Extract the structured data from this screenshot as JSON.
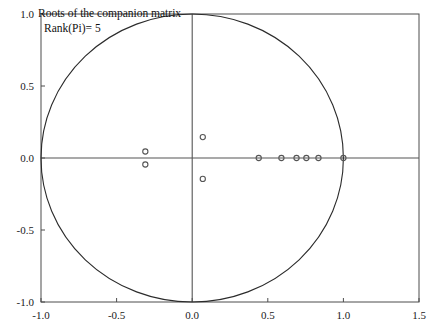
{
  "chart_data": {
    "type": "scatter",
    "title": "Roots of the companion matrix",
    "annotation": "Rank(Pi)= 5",
    "xlabel": "",
    "ylabel": "",
    "xlim": [
      -1.0,
      1.5
    ],
    "ylim": [
      -1.0,
      1.0
    ],
    "xticks": [
      "-1.0",
      "-0.5",
      "0.0",
      "0.5",
      "1.0",
      "1.5"
    ],
    "xtick_values": [
      -1.0,
      -0.5,
      0.0,
      0.5,
      1.0,
      1.5
    ],
    "yticks": [
      "-1.0",
      "-0.5",
      "0.0",
      "0.5",
      "1.0"
    ],
    "ytick_values": [
      -1.0,
      -0.5,
      0.0,
      0.5,
      1.0
    ],
    "grid": false,
    "legend": null,
    "marker": "open-circle",
    "reference_circle": {
      "label": "unit-circle",
      "center": [
        0.0,
        0.0
      ],
      "radius": 1.0
    },
    "series": [
      {
        "name": "roots",
        "x": [
          -0.31,
          -0.31,
          0.07,
          0.07,
          0.44,
          0.59,
          0.69,
          0.755,
          0.835,
          1.0
        ],
        "y": [
          0.045,
          -0.045,
          0.145,
          -0.145,
          0.0,
          0.0,
          0.0,
          0.0,
          0.0,
          0.0
        ]
      }
    ]
  },
  "axes": {
    "x_axis_name": "real-axis",
    "y_axis_name": "imaginary-axis"
  }
}
